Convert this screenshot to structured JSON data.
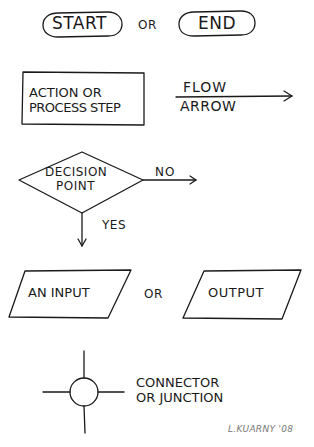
{
  "diagram": {
    "type": "flowchart-symbol-legend",
    "style": "hand-drawn",
    "stroke_color": "#1a1a1a",
    "background": "#ffffff"
  },
  "row1": {
    "start_label": "START",
    "or_label": "OR",
    "end_label": "END"
  },
  "row2": {
    "process_label_line1": "ACTION OR",
    "process_label_line2": "PROCESS STEP",
    "flow_label_top": "FLOW",
    "flow_label_bottom": "ARROW"
  },
  "row3": {
    "decision_line1": "DECISION",
    "decision_line2": "POINT",
    "no_label": "NO",
    "yes_label": "YES"
  },
  "row4": {
    "input_label": "AN INPUT",
    "or_label": "OR",
    "output_label": "OUTPUT"
  },
  "row5": {
    "connector_line1": "CONNECTOR",
    "connector_line2": "OR JUNCTION"
  },
  "signature": "L.KUARNY '08"
}
